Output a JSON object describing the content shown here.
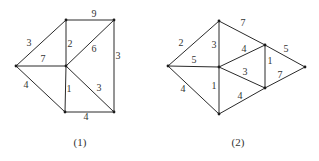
{
  "graphs": [
    {
      "id": "graph-1",
      "caption": "(1)",
      "caption_pos": [
        80,
        143
      ],
      "nodes": [
        {
          "id": "A",
          "x": 16,
          "y": 66
        },
        {
          "id": "B",
          "x": 66,
          "y": 20
        },
        {
          "id": "C",
          "x": 114,
          "y": 20
        },
        {
          "id": "D",
          "x": 66,
          "y": 66
        },
        {
          "id": "E",
          "x": 65,
          "y": 112
        },
        {
          "id": "F",
          "x": 114,
          "y": 112
        }
      ],
      "edges": [
        {
          "from": "A",
          "to": "B",
          "weight": "3",
          "lx": 29,
          "ly": 44
        },
        {
          "from": "B",
          "to": "C",
          "weight": "9",
          "lx": 94,
          "ly": 15
        },
        {
          "from": "A",
          "to": "D",
          "weight": "7",
          "lx": 43,
          "ly": 60
        },
        {
          "from": "B",
          "to": "D",
          "weight": "2",
          "lx": 70,
          "ly": 45
        },
        {
          "from": "D",
          "to": "C",
          "weight": "6",
          "lx": 94,
          "ly": 50
        },
        {
          "from": "C",
          "to": "F",
          "weight": "3",
          "lx": 118,
          "ly": 57
        },
        {
          "from": "A",
          "to": "E",
          "weight": "4",
          "lx": 26,
          "ly": 86
        },
        {
          "from": "D",
          "to": "E",
          "weight": "1",
          "lx": 69,
          "ly": 90
        },
        {
          "from": "D",
          "to": "F",
          "weight": "3",
          "lx": 99,
          "ly": 89
        },
        {
          "from": "E",
          "to": "F",
          "weight": "4",
          "lx": 86,
          "ly": 118
        }
      ]
    },
    {
      "id": "graph-2",
      "caption": "(2)",
      "caption_pos": [
        238,
        143
      ],
      "nodes": [
        {
          "id": "P",
          "x": 168,
          "y": 66
        },
        {
          "id": "Q",
          "x": 219,
          "y": 21
        },
        {
          "id": "R",
          "x": 265,
          "y": 45
        },
        {
          "id": "S",
          "x": 305,
          "y": 67
        },
        {
          "id": "T",
          "x": 219,
          "y": 67
        },
        {
          "id": "U",
          "x": 265,
          "y": 88
        },
        {
          "id": "V",
          "x": 219,
          "y": 114
        }
      ],
      "edges": [
        {
          "from": "P",
          "to": "Q",
          "weight": "2",
          "lx": 181,
          "ly": 44
        },
        {
          "from": "Q",
          "to": "R",
          "weight": "7",
          "lx": 243,
          "ly": 24
        },
        {
          "from": "P",
          "to": "T",
          "weight": "5",
          "lx": 194,
          "ly": 61
        },
        {
          "from": "Q",
          "to": "T",
          "weight": "3",
          "lx": 214,
          "ly": 46
        },
        {
          "from": "T",
          "to": "R",
          "weight": "4",
          "lx": 244,
          "ly": 50
        },
        {
          "from": "R",
          "to": "S",
          "weight": "5",
          "lx": 286,
          "ly": 50
        },
        {
          "from": "R",
          "to": "U",
          "weight": "1",
          "lx": 270,
          "ly": 62
        },
        {
          "from": "T",
          "to": "U",
          "weight": "3",
          "lx": 245,
          "ly": 73
        },
        {
          "from": "U",
          "to": "S",
          "weight": "7",
          "lx": 280,
          "ly": 76
        },
        {
          "from": "P",
          "to": "V",
          "weight": "4",
          "lx": 183,
          "ly": 90
        },
        {
          "from": "T",
          "to": "V",
          "weight": "1",
          "lx": 214,
          "ly": 87
        },
        {
          "from": "V",
          "to": "U",
          "weight": "4",
          "lx": 240,
          "ly": 97
        }
      ]
    }
  ]
}
